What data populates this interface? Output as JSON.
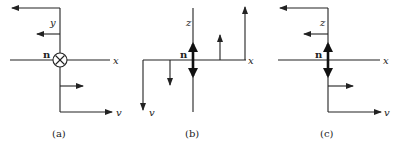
{
  "figure": {
    "panels": [
      {
        "id": "a",
        "caption": "(a)",
        "vertical_axis_label": "y",
        "horizontal_axis_label": "x",
        "vector_label": "v",
        "normal_label": "n",
        "normal_symbol": "into-page (circle with cross)"
      },
      {
        "id": "b",
        "caption": "(b)",
        "vertical_axis_label": "z",
        "horizontal_axis_label": "x",
        "vector_label": "v",
        "normal_label": "n",
        "normal_symbol": "double-headed arrow"
      },
      {
        "id": "c",
        "caption": "(c)",
        "vertical_axis_label": "z",
        "horizontal_axis_label": "x",
        "vector_label": "v",
        "normal_label": "n",
        "normal_symbol": "double-headed arrow"
      }
    ],
    "colors": {
      "ink": "#222222",
      "background": "#ffffff"
    }
  }
}
